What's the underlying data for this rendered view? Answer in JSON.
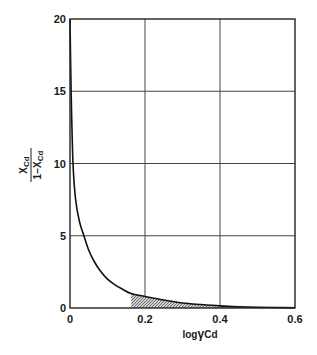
{
  "chart_data": {
    "type": "line",
    "title": "",
    "xlabel": "log γCd",
    "ylabel": "X_Cd / (1 − X_Cd)",
    "ylabel_parts": {
      "numerator": "X",
      "numerator_sub": "Cd",
      "denominator": "1−X",
      "denominator_sub": "Cd"
    },
    "xlabel_parts": {
      "prefix": "log",
      "greek": "γ",
      "sub": "Cd"
    },
    "xlim": [
      0,
      0.6
    ],
    "ylim": [
      0,
      20
    ],
    "x_ticks": [
      "0",
      "0.2",
      "0.4",
      "0.6"
    ],
    "y_ticks": [
      "0",
      "5",
      "10",
      "15",
      "20"
    ],
    "grid": true,
    "legend": null,
    "series": [
      {
        "name": "X_Cd/(1-X_Cd) vs log γCd",
        "x": [
          0.0,
          0.003,
          0.008,
          0.015,
          0.025,
          0.037,
          0.05,
          0.065,
          0.08,
          0.1,
          0.12,
          0.14,
          0.163,
          0.2,
          0.25,
          0.3,
          0.35,
          0.4,
          0.45,
          0.5,
          0.55,
          0.6
        ],
        "y": [
          20,
          15,
          10,
          7.5,
          6.0,
          5.0,
          4.0,
          3.2,
          2.6,
          2.0,
          1.6,
          1.3,
          1.0,
          0.8,
          0.55,
          0.35,
          0.24,
          0.15,
          0.09,
          0.05,
          0.03,
          0.02
        ]
      }
    ],
    "shaded_region": {
      "x_start": 0.163,
      "x_end": 0.6,
      "description": "hatched area under curve"
    }
  },
  "labels": {
    "y_num": "X",
    "y_num_sub": "Cd",
    "y_den": "1−X",
    "y_den_sub": "Cd",
    "x_prefix": "log",
    "x_greek": "γ",
    "x_sub": "Cd",
    "xt0": "0",
    "xt1": "0.2",
    "xt2": "0.4",
    "xt3": "0.6",
    "yt0": "0",
    "yt1": "5",
    "yt2": "10",
    "yt3": "15",
    "yt4": "20"
  }
}
